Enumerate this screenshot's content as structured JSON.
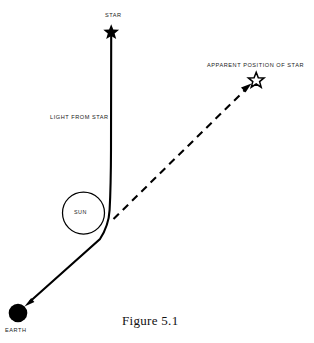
{
  "figure": {
    "caption": "Figure 5.1",
    "background_color": "#ffffff",
    "ink_color": "#000000"
  },
  "labels": {
    "star": "STAR",
    "apparent_position": "APPARENT POSITION OF STAR",
    "light_from_star": "LIGHT FROM STAR",
    "sun": "SUN",
    "earth": "EARTH"
  },
  "diagram_objects": [
    {
      "name": "star",
      "kind": "filled-star",
      "label": "STAR",
      "x": 111,
      "y": 31
    },
    {
      "name": "apparent-star",
      "kind": "outline-star",
      "label": "APPARENT POSITION OF STAR",
      "x": 256,
      "y": 79
    },
    {
      "name": "sun",
      "kind": "outline-circle",
      "label": "SUN",
      "x": 83,
      "y": 213,
      "radius": 21
    },
    {
      "name": "earth",
      "kind": "filled-circle",
      "label": "EARTH",
      "x": 18,
      "y": 313,
      "radius": 9
    }
  ],
  "paths": {
    "light_ray": {
      "name": "light-from-star-ray",
      "style": "solid",
      "description": "Curved ray bending around the Sun from Star to Earth",
      "start": [
        111,
        33
      ],
      "end": [
        26,
        305
      ]
    },
    "apparent_ray": {
      "name": "apparent-line-of-sight",
      "style": "dashed",
      "description": "Straight dashed sight-line from the bend point to the apparent star position",
      "start": [
        114,
        218
      ],
      "end": [
        249,
        86
      ]
    }
  }
}
